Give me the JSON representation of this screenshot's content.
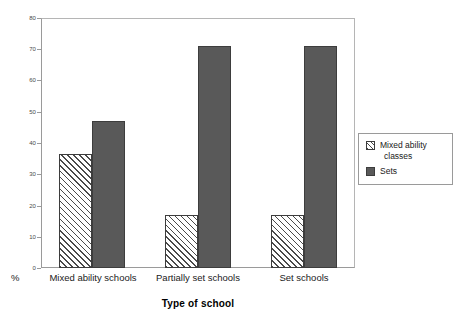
{
  "chart_data": {
    "type": "bar",
    "title": "",
    "xlabel": "Type of school",
    "ylabel": "%",
    "ylim": [
      0,
      80
    ],
    "yticks": [
      0,
      10,
      20,
      30,
      40,
      50,
      60,
      70,
      80
    ],
    "ytick_labels": [
      "0",
      "10",
      "20",
      "30",
      "40",
      "50",
      "60",
      "70",
      "80"
    ],
    "grid": false,
    "legend_position": "right",
    "categories": [
      "Mixed ability schools",
      "Partially set schools",
      "Set schools"
    ],
    "series": [
      {
        "name": "Mixed ability classes",
        "name_line1": "Mixed ability",
        "name_line2": "classes",
        "fill": "hatch",
        "color": "#4a4a4a",
        "values": [
          36.5,
          17,
          17
        ]
      },
      {
        "name": "Sets",
        "name_line1": "Sets",
        "name_line2": "",
        "fill": "solid",
        "color": "#595959",
        "values": [
          47,
          71,
          71
        ]
      }
    ]
  },
  "axis": {
    "percent_symbol": "%",
    "x_title": "Type of school"
  },
  "legend": {
    "items": [
      {
        "label_line1": "Mixed ability",
        "label_line2": "classes"
      },
      {
        "label_line1": "Sets",
        "label_line2": ""
      }
    ]
  },
  "colors": {
    "frame": "#9a9a9a",
    "bar_outline": "#3d3d3d",
    "solid_fill": "#595959",
    "hatch_stroke": "#4a4a4a",
    "background": "#ffffff"
  }
}
